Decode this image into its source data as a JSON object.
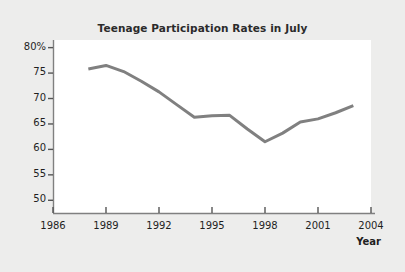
{
  "chart_data": {
    "type": "line",
    "title": "Teenage Participation Rates in July",
    "xlabel": "Year",
    "ylabel": "",
    "xlim": [
      1986,
      2004
    ],
    "ylim": [
      47.5,
      81.5
    ],
    "grid": false,
    "legend": null,
    "xticks": [
      "1986",
      "1989",
      "1992",
      "1995",
      "1998",
      "2001",
      "2004"
    ],
    "xtick_values": [
      1986,
      1989,
      1992,
      1995,
      1998,
      2001,
      2004
    ],
    "yticks": [
      "80%",
      "75",
      "70",
      "65",
      "60",
      "55",
      "50"
    ],
    "ytick_values": [
      80,
      75,
      70,
      65,
      60,
      55,
      50
    ],
    "line_color": "#808080",
    "line_width": 3,
    "x": [
      1988,
      1989,
      1990,
      1991,
      1992,
      1993,
      1994,
      1995,
      1996,
      1997,
      1998,
      1999,
      2000,
      2001,
      2002,
      2003
    ],
    "values": [
      75.8,
      76.5,
      75.3,
      73.4,
      71.3,
      68.8,
      66.3,
      66.6,
      66.7,
      64.0,
      61.5,
      63.2,
      65.4,
      66.0,
      67.2,
      68.6
    ],
    "series": [
      {
        "name": "Teenage participation rate",
        "values": [
          75.8,
          76.5,
          75.3,
          73.4,
          71.3,
          68.8,
          66.3,
          66.6,
          66.7,
          64.0,
          61.5,
          63.2,
          65.4,
          66.0,
          67.2,
          68.6
        ]
      }
    ]
  },
  "figure": {
    "background_color": "#ededec",
    "plot_background_color": "#ffffff",
    "axis_color": "#808080"
  }
}
